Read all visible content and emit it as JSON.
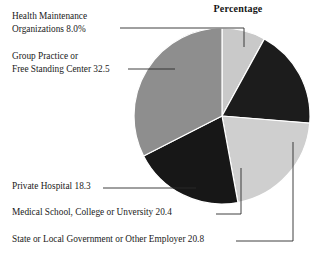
{
  "chart_data": {
    "type": "pie",
    "title": "Percentage",
    "xlabel": "",
    "ylabel": "",
    "legend_position": "callout-labels",
    "grid": false,
    "start_angle_deg": 0,
    "direction": "clockwise",
    "categories": [
      "Health Maintenance Organizations",
      "Private Hospital",
      "State or Local Government or Other Employer",
      "Medical School, College or Unversity",
      "Group Practice or Free Standing Center"
    ],
    "values": [
      8.0,
      18.3,
      20.8,
      20.4,
      32.5
    ],
    "value_labels": [
      "8.0%",
      "18.3",
      "20.8",
      "20.4",
      "32.5"
    ],
    "colors": [
      "#c9c9c9",
      "#1c1c1c",
      "#cfcfcf",
      "#171717",
      "#8e8e8e"
    ],
    "slices": [
      {
        "name": "Health Maintenance Organizations",
        "value": 8.0,
        "value_label": "8.0%",
        "color": "#c9c9c9",
        "start_deg": 0,
        "sweep_deg": 28.8
      },
      {
        "name": "Private Hospital",
        "value": 18.3,
        "value_label": "18.3",
        "color": "#1c1c1c",
        "start_deg": 28.8,
        "sweep_deg": 65.88
      },
      {
        "name": "State or Local Government or Other Employer",
        "value": 20.8,
        "value_label": "20.8",
        "color": "#cfcfcf",
        "start_deg": 94.68,
        "sweep_deg": 74.88
      },
      {
        "name": "Medical School, College or Unversity",
        "value": 20.4,
        "value_label": "20.4",
        "color": "#171717",
        "start_deg": 169.56,
        "sweep_deg": 73.44
      },
      {
        "name": "Group Practice or Free Standing Center",
        "value": 32.5,
        "value_label": "32.5",
        "color": "#8e8e8e",
        "start_deg": 243.0,
        "sweep_deg": 117.0
      }
    ]
  },
  "title": "Percentage",
  "labels": {
    "hmo_line1": "Health Maintenance",
    "hmo_line2": "Organizations 8.0%",
    "group_line1": "Group Practice or",
    "group_line2": "Free Standing Center 32.5",
    "private_hospital": "Private Hospital 18.3",
    "medical_school": "Medical School, College or Unversity 20.4",
    "state_local": "State or Local Government or Other Employer  20.8"
  }
}
